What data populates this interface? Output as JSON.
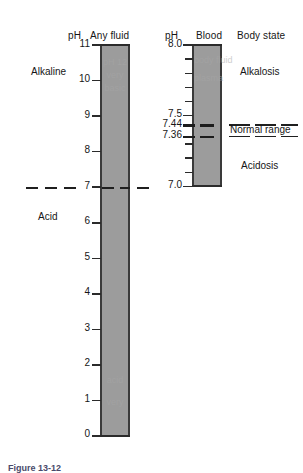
{
  "figure": {
    "caption": "Figure 13-12"
  },
  "headers": {
    "ph_left": "pH",
    "column_left": "Any fluid",
    "ph_right": "pH",
    "column_right": "Blood",
    "body_state": "Body state"
  },
  "left_scale": {
    "label_top": "Alkaline",
    "label_bottom": "Acid",
    "ticks": [
      "11",
      "10",
      "9",
      "8",
      "7",
      "6",
      "5",
      "4",
      "3",
      "2",
      "1",
      "0"
    ],
    "min": 0,
    "max": 11,
    "neutral": "7"
  },
  "right_scale": {
    "ticks_major": [
      "8.0",
      "7.5",
      "7.0"
    ],
    "min": 7.0,
    "max": 8.0,
    "minor_step": 0.1,
    "normal_range_high": "7.44",
    "normal_range_low": "7.36",
    "normal_range_label": "Normal range"
  },
  "body_states": {
    "alkalosis": "Alkalosis",
    "acidosis": "Acidosis"
  },
  "ghost_text": {
    "left_top": "pH 12",
    "left_top2": "very",
    "left_mid": "basic",
    "left_low": "acid",
    "left_low2": "very",
    "right_top": "body fluid",
    "right_mid": "plasma"
  },
  "colors": {
    "bar_fill": "#9c9c9c",
    "bar_edge": "#3a3a3a",
    "ink": "#161616",
    "caption": "#4a4a6a"
  }
}
